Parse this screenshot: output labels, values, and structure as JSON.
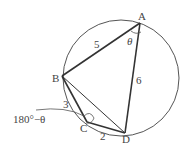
{
  "diagram": {
    "points": {
      "A": {
        "label": "A",
        "x": 140,
        "y": 23
      },
      "B": {
        "label": "B",
        "x": 62,
        "y": 76
      },
      "C": {
        "label": "C",
        "x": 87,
        "y": 122
      },
      "D": {
        "label": "D",
        "x": 125,
        "y": 133
      }
    },
    "circle": {
      "cx": 121,
      "cy": 78,
      "r": 58
    },
    "edges": [
      {
        "from": "A",
        "to": "B",
        "length_label": "5"
      },
      {
        "from": "A",
        "to": "D",
        "length_label": "6"
      },
      {
        "from": "B",
        "to": "C",
        "length_label": "3"
      },
      {
        "from": "C",
        "to": "D",
        "length_label": "2"
      },
      {
        "from": "B",
        "to": "D",
        "length_label": ""
      }
    ],
    "angles": {
      "A": "θ",
      "C": "180°−θ"
    },
    "colors": {
      "stroke": "#333333",
      "circle": "#555555",
      "text": "#444444"
    }
  }
}
